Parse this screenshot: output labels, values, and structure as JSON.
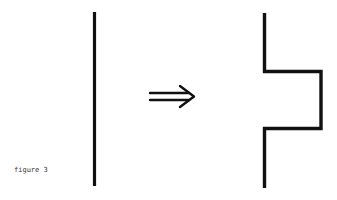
{
  "figure": {
    "caption": "figure 3",
    "arrow_glyph": "⇒",
    "colors": {
      "stroke": "#111111",
      "background": "#ffffff"
    },
    "left_shape": "straight vertical line",
    "right_shape": "vertical line with rectangular bump to the right"
  }
}
